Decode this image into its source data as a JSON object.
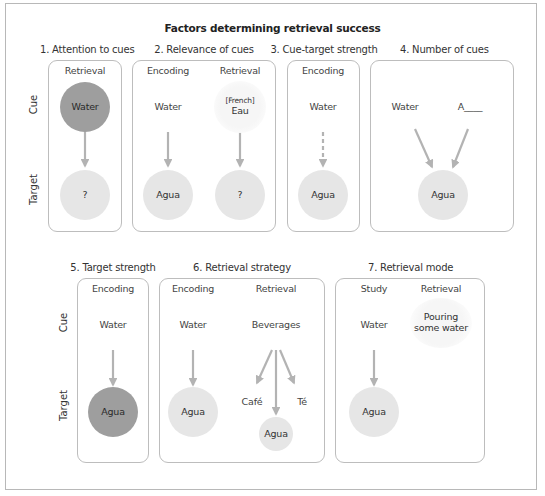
{
  "title": "Factors determining retrieval success",
  "row_labels": {
    "cue": "Cue",
    "target": "Target"
  },
  "colors": {
    "arrow": "#b3b3b3",
    "circle_dark": "#9e9e9e",
    "circle_light": "#e6e6e6",
    "panel_border": "#bdbdbd",
    "frame_border": "#b8b8b8"
  },
  "panels": [
    {
      "title": "1. Attention to cues",
      "columns": [
        {
          "header": "Retrieval",
          "cue": "Water",
          "cue_style": "dark-circle",
          "target": "?",
          "target_style": "light-circle",
          "arrow": "solid"
        }
      ]
    },
    {
      "title": "2. Relevance of cues",
      "columns": [
        {
          "header": "Encoding",
          "cue": "Water",
          "cue_style": "text",
          "target": "Agua",
          "target_style": "light-circle",
          "arrow": "solid"
        },
        {
          "header": "Retrieval",
          "cue_note": "[French]",
          "cue": "Eau",
          "cue_style": "faint-circle",
          "target": "?",
          "target_style": "light-circle",
          "arrow": "solid"
        }
      ]
    },
    {
      "title": "3. Cue-target strength",
      "columns": [
        {
          "header": "Encoding",
          "cue": "Water",
          "cue_style": "text",
          "target": "Agua",
          "target_style": "light-circle",
          "arrow": "dashed"
        }
      ]
    },
    {
      "title": "4. Number of cues",
      "cues": [
        "Water",
        "A____"
      ],
      "target": "Agua",
      "target_style": "light-circle",
      "arrow": "converging"
    },
    {
      "title": "5. Target strength",
      "columns": [
        {
          "header": "Encoding",
          "cue": "Water",
          "cue_style": "text",
          "target": "Agua",
          "target_style": "dark-circle",
          "arrow": "solid"
        }
      ]
    },
    {
      "title": "6. Retrieval strategy",
      "columns": [
        {
          "header": "Encoding",
          "cue": "Water",
          "cue_style": "text",
          "target": "Agua",
          "target_style": "light-circle",
          "arrow": "solid"
        },
        {
          "header": "Retrieval",
          "cue": "Beverages",
          "cue_style": "text",
          "targets": [
            "Café",
            "Agua",
            "Té"
          ],
          "arrow": "diverging"
        }
      ]
    },
    {
      "title": "7. Retrieval mode",
      "columns": [
        {
          "header": "Study",
          "cue": "Water",
          "cue_style": "text",
          "target": "Agua",
          "target_style": "light-circle",
          "arrow": "solid"
        },
        {
          "header": "Retrieval",
          "cue": "Pouring some water",
          "cue_line1": "Pouring",
          "cue_line2": "some water",
          "cue_style": "faint-circle"
        }
      ]
    }
  ]
}
